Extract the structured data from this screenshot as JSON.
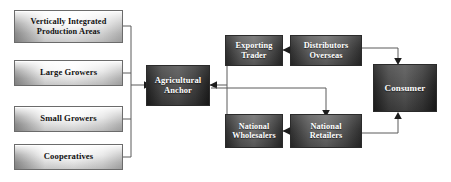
{
  "diagram": {
    "background_color": "#ffffff",
    "connector_color": "#5a5a5a",
    "arrowhead_color": "#1c1c1c",
    "light_node_text_color": "#111111",
    "dark_node_text_color": "#ffffff",
    "nodes": [
      {
        "id": "vertically-integrated-production-areas",
        "label": "Vertically Integrated\nProduction Areas",
        "style": "light"
      },
      {
        "id": "large-growers",
        "label": "Large Growers",
        "style": "light"
      },
      {
        "id": "small-growers",
        "label": "Small Growers",
        "style": "light"
      },
      {
        "id": "cooperatives",
        "label": "Cooperatives",
        "style": "light"
      },
      {
        "id": "agricultural-anchor",
        "label": "Agricultural\nAnchor",
        "style": "dark"
      },
      {
        "id": "exporting-trader",
        "label": "Exporting\nTrader",
        "style": "dark"
      },
      {
        "id": "distributors-overseas",
        "label": "Distributors\nOverseas",
        "style": "dark"
      },
      {
        "id": "national-wholesalers",
        "label": "National\nWholesalers",
        "style": "dark"
      },
      {
        "id": "national-retailers",
        "label": "National\nRetailers",
        "style": "dark"
      },
      {
        "id": "consumer",
        "label": "Consumer",
        "style": "dark"
      }
    ],
    "edges": [
      {
        "id": "edge-suppliers-to-anchor",
        "from": "supplier-bus",
        "to": "agricultural-anchor"
      },
      {
        "id": "edge-vertically-integrated-to-bus",
        "from": "vertically-integrated-production-areas",
        "to": "supplier-bus"
      },
      {
        "id": "edge-large-growers-to-bus",
        "from": "large-growers",
        "to": "supplier-bus"
      },
      {
        "id": "edge-small-growers-to-bus",
        "from": "small-growers",
        "to": "supplier-bus"
      },
      {
        "id": "edge-cooperatives-to-bus",
        "from": "cooperatives",
        "to": "supplier-bus"
      },
      {
        "id": "edge-exporting-trader-to-anchor",
        "from": "exporting-trader",
        "to": "agricultural-anchor"
      },
      {
        "id": "edge-distributors-to-exporting-trader",
        "from": "distributors-overseas",
        "to": "exporting-trader"
      },
      {
        "id": "edge-distributors-to-consumer",
        "from": "distributors-overseas",
        "to": "consumer"
      },
      {
        "id": "edge-anchor-to-national-retailers",
        "from": "agricultural-anchor",
        "to": "national-retailers"
      },
      {
        "id": "edge-national-retailers-to-wholesalers",
        "from": "national-retailers",
        "to": "national-wholesalers"
      },
      {
        "id": "edge-national-wholesalers-to-anchor",
        "from": "national-wholesalers",
        "to": "agricultural-anchor"
      },
      {
        "id": "edge-national-retailers-to-consumer",
        "from": "national-retailers",
        "to": "consumer"
      }
    ]
  }
}
